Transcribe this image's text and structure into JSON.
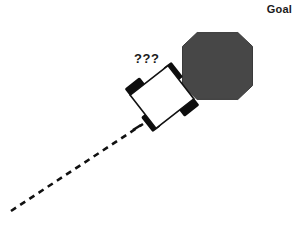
{
  "figure": {
    "background_color": "#ffffff",
    "width": 295,
    "height": 228,
    "goal_label": "Goal",
    "uncertainty_label": "???"
  },
  "colors": {
    "goal_fill": "#474747",
    "goal_stroke": "#2b2b2b",
    "outline": "#111111",
    "wheel": "#0d0d0d",
    "body_fill": "#ffffff",
    "path": "#111111",
    "text": "#1a1a1a"
  },
  "diagram_data": {
    "type": "diagram",
    "description": "Robot vehicle with uncertain heading approaching an octagonal goal region",
    "elements": [
      {
        "name": "goal-region",
        "shape": "octagon",
        "center": [
          217.5,
          66
        ],
        "radius": 35,
        "fill": "#474747"
      },
      {
        "name": "vehicle-body",
        "shape": "rectangle",
        "center": [
          162,
          97
        ],
        "width": 48,
        "height": 42,
        "rotation_deg": -38,
        "fill": "#ffffff"
      },
      {
        "name": "traveled-path",
        "shape": "dashed-line",
        "from": [
          11,
          211
        ],
        "to": [
          143,
          124
        ],
        "dash": "6 5"
      }
    ],
    "wheels": [
      {
        "name": "wheel-front-left",
        "offset": [
          -12,
          -24
        ]
      },
      {
        "name": "wheel-front-right",
        "offset": [
          18,
          -14
        ]
      },
      {
        "name": "wheel-rear-left",
        "offset": [
          -18,
          14
        ]
      },
      {
        "name": "wheel-rear-right",
        "offset": [
          12,
          24
        ]
      }
    ]
  }
}
